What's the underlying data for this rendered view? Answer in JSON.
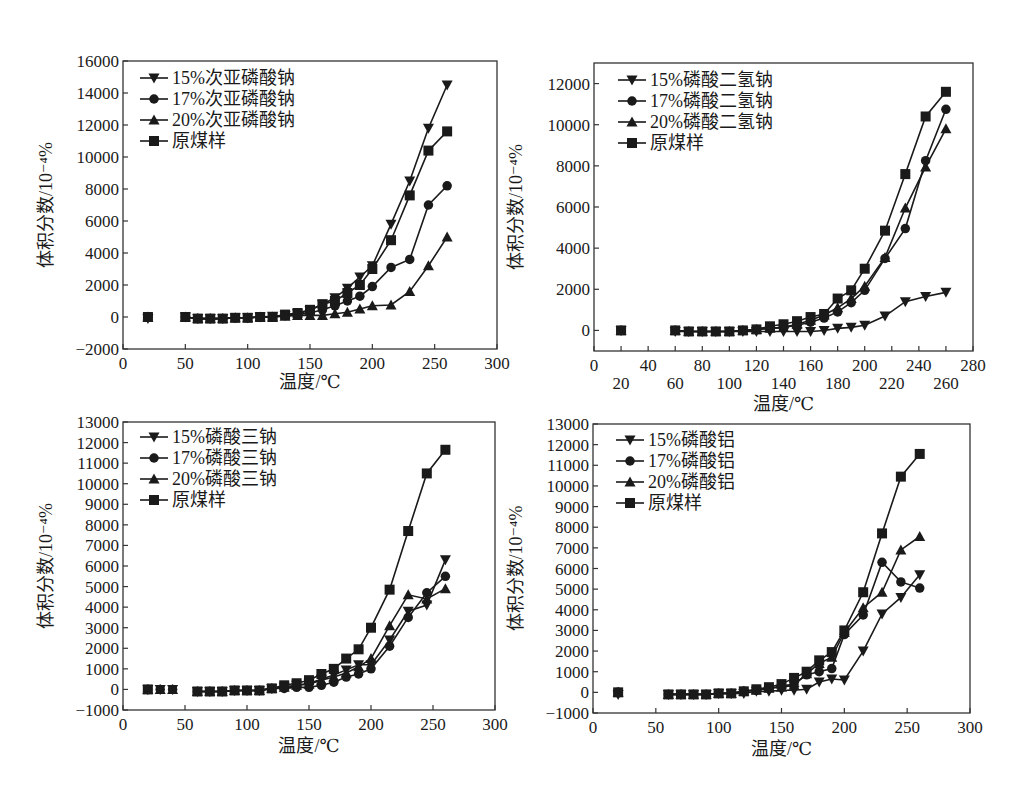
{
  "figure": {
    "caption_visible": ""
  },
  "chart_data": [
    {
      "type": "line",
      "id": "hypophosphite",
      "title": "",
      "xlabel": "温度/℃",
      "ylabel": "体积分数/10⁻⁴%",
      "xlim": [
        0,
        300
      ],
      "ylim": [
        -2000,
        16000
      ],
      "xticks": [
        0,
        50,
        100,
        150,
        200,
        250,
        300
      ],
      "yticks": [
        -2000,
        0,
        2000,
        4000,
        6000,
        8000,
        10000,
        12000,
        14000,
        16000
      ],
      "grid": false,
      "legend_position": "upper left",
      "series": [
        {
          "name": "15%次亚磷酸钠",
          "marker": "triangle-down",
          "x": [
            20,
            50,
            60,
            70,
            80,
            90,
            100,
            110,
            120,
            130,
            140,
            150,
            160,
            170,
            180,
            190,
            200,
            215,
            230,
            245,
            260
          ],
          "y": [
            -100,
            0,
            -100,
            -100,
            -100,
            -50,
            -50,
            0,
            50,
            100,
            200,
            400,
            800,
            1200,
            1800,
            2500,
            3200,
            5800,
            8500,
            11800,
            14500
          ]
        },
        {
          "name": "17%次亚磷酸钠",
          "marker": "circle",
          "x": [
            20,
            50,
            60,
            70,
            80,
            90,
            100,
            110,
            120,
            130,
            140,
            150,
            160,
            170,
            180,
            190,
            200,
            215,
            230,
            245,
            260
          ],
          "y": [
            0,
            0,
            -100,
            -100,
            -100,
            -50,
            -50,
            0,
            0,
            100,
            150,
            250,
            450,
            700,
            1000,
            1300,
            1900,
            3100,
            3600,
            7000,
            8200
          ]
        },
        {
          "name": "20%次亚磷酸钠",
          "marker": "triangle-up",
          "x": [
            20,
            50,
            60,
            70,
            80,
            90,
            100,
            110,
            120,
            130,
            140,
            150,
            160,
            170,
            180,
            190,
            200,
            215,
            230,
            245,
            260
          ],
          "y": [
            0,
            0,
            -100,
            -100,
            -100,
            -50,
            -50,
            0,
            0,
            50,
            100,
            100,
            100,
            200,
            300,
            500,
            700,
            750,
            1600,
            3200,
            5000
          ]
        },
        {
          "name": "原煤样",
          "marker": "square",
          "x": [
            20,
            50,
            60,
            70,
            80,
            90,
            100,
            110,
            120,
            130,
            140,
            150,
            160,
            170,
            180,
            190,
            200,
            215,
            230,
            245,
            260
          ],
          "y": [
            0,
            0,
            -100,
            -100,
            -100,
            -50,
            -50,
            0,
            0,
            150,
            250,
            450,
            800,
            1000,
            1500,
            2000,
            3000,
            4800,
            7600,
            10400,
            11600
          ]
        }
      ]
    },
    {
      "type": "line",
      "id": "dihydrogen-phosphate",
      "title": "",
      "xlabel": "温度/℃",
      "ylabel": "体积分数/10⁻⁴%",
      "xlim": [
        0,
        280
      ],
      "ylim": [
        -1000,
        13000
      ],
      "xticks_upper": [
        0,
        40,
        80,
        120,
        160,
        200,
        240,
        280
      ],
      "xticks_lower": [
        20,
        60,
        100,
        140,
        180,
        220,
        260
      ],
      "yticks": [
        0,
        2000,
        4000,
        6000,
        8000,
        10000,
        12000
      ],
      "grid": false,
      "legend_position": "upper left",
      "series": [
        {
          "name": "15%磷酸二氢钠",
          "marker": "triangle-down",
          "x": [
            20,
            60,
            70,
            80,
            90,
            100,
            110,
            120,
            130,
            140,
            150,
            160,
            170,
            180,
            190,
            200,
            215,
            230,
            245,
            260
          ],
          "y": [
            0,
            -50,
            -50,
            -50,
            -50,
            -50,
            -50,
            -50,
            -50,
            -50,
            -50,
            -50,
            0,
            100,
            150,
            250,
            700,
            1400,
            1650,
            1850
          ]
        },
        {
          "name": "17%磷酸二氢钠",
          "marker": "circle",
          "x": [
            20,
            60,
            70,
            80,
            90,
            100,
            110,
            120,
            130,
            140,
            150,
            160,
            170,
            180,
            190,
            200,
            215,
            230,
            245,
            260
          ],
          "y": [
            0,
            0,
            -50,
            -50,
            -50,
            -50,
            0,
            50,
            100,
            150,
            250,
            400,
            600,
            900,
            1350,
            1950,
            3500,
            4950,
            8250,
            10750
          ]
        },
        {
          "name": "20%磷酸二氢钠",
          "marker": "triangle-up",
          "x": [
            20,
            60,
            70,
            80,
            90,
            100,
            110,
            120,
            130,
            140,
            150,
            160,
            170,
            180,
            190,
            200,
            215,
            230,
            245,
            260
          ],
          "y": [
            0,
            0,
            -50,
            -50,
            -50,
            -50,
            0,
            50,
            100,
            150,
            300,
            500,
            750,
            1100,
            1550,
            2150,
            3550,
            5950,
            7950,
            9800
          ]
        },
        {
          "name": "原煤样",
          "marker": "square",
          "x": [
            20,
            60,
            70,
            80,
            90,
            100,
            110,
            120,
            130,
            140,
            150,
            160,
            170,
            180,
            190,
            200,
            215,
            230,
            245,
            260
          ],
          "y": [
            0,
            0,
            -50,
            -50,
            -50,
            -50,
            0,
            50,
            200,
            300,
            450,
            650,
            800,
            1550,
            1950,
            3000,
            4850,
            7600,
            10400,
            11600
          ]
        }
      ]
    },
    {
      "type": "line",
      "id": "trisodium-phosphate",
      "title": "",
      "xlabel": "温度/℃",
      "ylabel": "体积分数/10⁻⁴%",
      "xlim": [
        0,
        300
      ],
      "ylim": [
        -1000,
        13000
      ],
      "xticks": [
        0,
        50,
        100,
        150,
        200,
        250,
        300
      ],
      "yticks": [
        -1000,
        0,
        1000,
        2000,
        3000,
        4000,
        5000,
        6000,
        7000,
        8000,
        9000,
        10000,
        11000,
        12000,
        13000
      ],
      "grid": false,
      "legend_position": "upper left",
      "series": [
        {
          "name": "15%磷酸三钠",
          "marker": "triangle-down",
          "x": [
            20,
            30,
            40,
            60,
            70,
            80,
            90,
            100,
            110,
            120,
            130,
            140,
            150,
            160,
            170,
            180,
            190,
            200,
            215,
            230,
            245,
            260
          ],
          "y": [
            0,
            0,
            0,
            -100,
            -100,
            -100,
            -50,
            -50,
            -50,
            50,
            100,
            200,
            300,
            500,
            700,
            950,
            1200,
            1200,
            2400,
            3800,
            4100,
            6300
          ]
        },
        {
          "name": "17%磷酸三钠",
          "marker": "circle",
          "x": [
            20,
            30,
            40,
            60,
            70,
            80,
            90,
            100,
            110,
            120,
            130,
            140,
            150,
            160,
            170,
            180,
            190,
            200,
            215,
            230,
            245,
            260
          ],
          "y": [
            0,
            0,
            0,
            -100,
            -100,
            -100,
            -50,
            -50,
            -50,
            50,
            50,
            100,
            100,
            200,
            350,
            600,
            750,
            1000,
            2100,
            3500,
            4700,
            5500
          ]
        },
        {
          "name": "20%磷酸三钠",
          "marker": "triangle-up",
          "x": [
            20,
            30,
            40,
            60,
            70,
            80,
            90,
            100,
            110,
            120,
            130,
            140,
            150,
            160,
            170,
            180,
            190,
            200,
            215,
            230,
            245,
            260
          ],
          "y": [
            0,
            0,
            0,
            -100,
            -100,
            -100,
            -50,
            -50,
            -50,
            50,
            100,
            200,
            250,
            450,
            600,
            800,
            1100,
            1500,
            3100,
            4600,
            4400,
            4900
          ]
        },
        {
          "name": "原煤样",
          "marker": "square",
          "x": [
            20,
            60,
            70,
            80,
            90,
            100,
            110,
            120,
            130,
            140,
            150,
            160,
            170,
            180,
            190,
            200,
            215,
            230,
            245,
            260
          ],
          "y": [
            0,
            -100,
            -100,
            -100,
            -50,
            -50,
            -50,
            50,
            200,
            300,
            450,
            750,
            1000,
            1500,
            1950,
            3000,
            4850,
            7700,
            10500,
            11650
          ]
        }
      ]
    },
    {
      "type": "line",
      "id": "aluminum-phosphate",
      "title": "",
      "xlabel": "温度/℃",
      "ylabel": "体积分数/10⁻⁴%",
      "xlim": [
        0,
        300
      ],
      "ylim": [
        -1000,
        13000
      ],
      "xticks": [
        0,
        50,
        100,
        150,
        200,
        250,
        300
      ],
      "yticks": [
        -1000,
        0,
        1000,
        2000,
        3000,
        4000,
        5000,
        6000,
        7000,
        8000,
        9000,
        10000,
        11000,
        12000,
        13000
      ],
      "grid": false,
      "legend_position": "upper left",
      "series": [
        {
          "name": "15%磷酸铝",
          "marker": "triangle-down",
          "x": [
            20,
            60,
            70,
            80,
            90,
            100,
            110,
            120,
            130,
            140,
            150,
            160,
            170,
            180,
            190,
            200,
            215,
            230,
            245,
            260
          ],
          "y": [
            -100,
            -100,
            -100,
            -100,
            -100,
            -50,
            -50,
            -50,
            50,
            50,
            100,
            100,
            150,
            500,
            650,
            600,
            2000,
            3800,
            4600,
            5700
          ]
        },
        {
          "name": "17%磷酸铝",
          "marker": "circle",
          "x": [
            20,
            60,
            70,
            80,
            90,
            100,
            110,
            120,
            130,
            140,
            150,
            160,
            170,
            180,
            190,
            200,
            215,
            230,
            245,
            260
          ],
          "y": [
            0,
            -100,
            -100,
            -100,
            -100,
            -50,
            -50,
            50,
            100,
            200,
            300,
            400,
            850,
            1000,
            1150,
            2800,
            3750,
            6300,
            5350,
            5050
          ]
        },
        {
          "name": "20%磷酸铝",
          "marker": "triangle-up",
          "x": [
            20,
            60,
            70,
            80,
            90,
            100,
            110,
            120,
            130,
            140,
            150,
            160,
            170,
            180,
            190,
            200,
            215,
            230,
            245,
            260
          ],
          "y": [
            0,
            -100,
            -100,
            -100,
            -100,
            -50,
            -50,
            50,
            100,
            200,
            250,
            350,
            900,
            1400,
            1700,
            2900,
            4100,
            4850,
            6900,
            7550
          ]
        },
        {
          "name": "原煤样",
          "marker": "square",
          "x": [
            20,
            60,
            70,
            80,
            90,
            100,
            110,
            120,
            130,
            140,
            150,
            160,
            170,
            180,
            190,
            200,
            215,
            230,
            245,
            260
          ],
          "y": [
            0,
            -100,
            -100,
            -100,
            -100,
            -50,
            -50,
            50,
            150,
            250,
            400,
            700,
            1000,
            1550,
            1950,
            3000,
            4850,
            7700,
            10450,
            11550
          ]
        }
      ]
    }
  ],
  "layout": [
    {
      "box": {
        "left": 123,
        "top": 61,
        "right": 497,
        "bottom": 349
      },
      "ylabel_x": 52,
      "xlabel_y": 388,
      "legend": {
        "x": 140,
        "y": 78,
        "dy": 21
      }
    },
    {
      "box": {
        "left": 594,
        "top": 63,
        "right": 973,
        "bottom": 351
      },
      "ylabel_x": 522,
      "xlabel_y": 410,
      "legend": {
        "x": 618,
        "y": 80,
        "dy": 21
      }
    },
    {
      "box": {
        "left": 123,
        "top": 422,
        "right": 495,
        "bottom": 710
      },
      "ylabel_x": 52,
      "xlabel_y": 752,
      "legend": {
        "x": 140,
        "y": 437,
        "dy": 21
      }
    },
    {
      "box": {
        "left": 593,
        "top": 424,
        "right": 970,
        "bottom": 713
      },
      "ylabel_x": 522,
      "xlabel_y": 755,
      "legend": {
        "x": 616,
        "y": 440,
        "dy": 21
      }
    }
  ]
}
